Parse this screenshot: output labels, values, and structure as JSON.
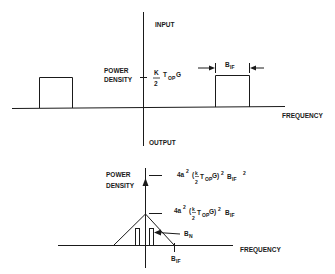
{
  "top_panel": {
    "axis_top_label": "INPUT",
    "axis_bottom_label": "OUTPUT",
    "y_label_line1": "POWER",
    "y_label_line2": "DENSITY",
    "x_label": "FREQUENCY",
    "level_numerator": "K",
    "level_denominator": "2",
    "level_T": "T",
    "level_sub": "OP",
    "level_G": "G",
    "bandwidth_B": "B",
    "bandwidth_sub": "IF"
  },
  "bottom_panel": {
    "y_label_line1": "POWER",
    "y_label_line2": "DENSITY",
    "x_label": "FREQUENCY",
    "upper_level": {
      "coef": "4a",
      "coef_exp": "2",
      "frac_num": "k",
      "frac_den": "2",
      "T": "T",
      "T_sub": "OP",
      "G": "G)",
      "paren_exp": "2",
      "B": "B",
      "B_sub": "IF",
      "B_exp": "2",
      "open": "("
    },
    "lower_level": {
      "coef": "4a",
      "coef_exp": "2",
      "frac_num": "k",
      "frac_den": "2",
      "T": "T",
      "T_sub": "OP",
      "G": "G)",
      "paren_exp": "2",
      "B": "B",
      "B_sub": "IF",
      "open": "("
    },
    "bn_B": "B",
    "bn_sub": "N",
    "bif_B": "B",
    "bif_sub": "IF"
  },
  "colors": {
    "line": "#1a1a1a",
    "background": "#ffffff"
  }
}
